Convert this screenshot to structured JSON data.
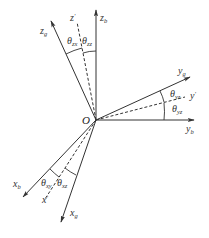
{
  "diagram": {
    "title": "",
    "origin_label": "O",
    "axes": {
      "z_b": {
        "base": "z",
        "sub": "b",
        "prime": ""
      },
      "z_prime": {
        "base": "z",
        "sub": "",
        "prime": "′"
      },
      "z_g": {
        "base": "z",
        "sub": "g",
        "prime": ""
      },
      "y_b": {
        "base": "y",
        "sub": "b",
        "prime": ""
      },
      "y_prime": {
        "base": "y",
        "sub": "",
        "prime": "′"
      },
      "y_g": {
        "base": "y",
        "sub": "g",
        "prime": ""
      },
      "x_b": {
        "base": "x",
        "sub": "b",
        "prime": ""
      },
      "x_prime": {
        "base": "x",
        "sub": "",
        "prime": "′"
      },
      "x_g": {
        "base": "x",
        "sub": "g",
        "prime": ""
      }
    },
    "angles": {
      "z_upper_left": {
        "base": "θ",
        "sub": "zx"
      },
      "z_upper_right": {
        "base": "θ",
        "sub": "zz"
      },
      "y_upper": {
        "base": "θ",
        "sub": "yz"
      },
      "y_lower": {
        "base": "θ",
        "sub": "yz"
      },
      "x_left": {
        "base": "θ",
        "sub": "xy"
      },
      "x_right": {
        "base": "θ",
        "sub": "xz"
      }
    },
    "colors": {
      "line": "#333333",
      "background": "#ffffff"
    }
  }
}
